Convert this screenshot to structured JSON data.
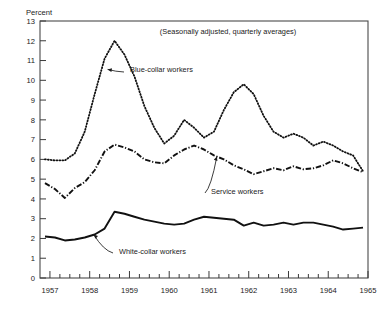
{
  "chart_data": {
    "type": "line",
    "title": "",
    "subtitle": "",
    "note": "(Seasonally adjusted, quarterly averages)",
    "ylabel": "Percent",
    "xlabel": "",
    "ylim": [
      0,
      13
    ],
    "xlim": [
      1956.75,
      1965.0
    ],
    "grid": false,
    "legend_position": "inline-annotations",
    "yticks": [
      0,
      1,
      2,
      3,
      4,
      5,
      6,
      7,
      8,
      9,
      10,
      11,
      12,
      13
    ],
    "ytick_labels": [
      "0",
      "1",
      "2",
      "3",
      "4",
      "5",
      "6",
      "7",
      "8",
      "9",
      "10",
      "11",
      "12",
      "13"
    ],
    "xticks": [
      1957,
      1958,
      1959,
      1960,
      1961,
      1962,
      1963,
      1964,
      1965
    ],
    "xtick_labels": [
      "1957",
      "1958",
      "1959",
      "1960",
      "1961",
      "1962",
      "1963",
      "1964",
      "1965"
    ],
    "x": [
      1956.875,
      1957.125,
      1957.375,
      1957.625,
      1957.875,
      1958.125,
      1958.375,
      1958.625,
      1958.875,
      1959.125,
      1959.375,
      1959.625,
      1959.875,
      1960.125,
      1960.375,
      1960.625,
      1960.875,
      1961.125,
      1961.375,
      1961.625,
      1961.875,
      1962.125,
      1962.375,
      1962.625,
      1962.875,
      1963.125,
      1963.375,
      1963.625,
      1963.875,
      1964.125,
      1964.375,
      1964.625,
      1964.875
    ],
    "series": [
      {
        "name": "Blue-collar workers",
        "style": "dotted",
        "color": "#111111",
        "values": [
          6.0,
          5.95,
          5.95,
          6.3,
          7.4,
          9.3,
          11.1,
          12.0,
          11.3,
          10.2,
          8.7,
          7.6,
          6.8,
          7.2,
          8.0,
          7.6,
          7.1,
          7.4,
          8.5,
          9.4,
          9.8,
          9.3,
          8.2,
          7.4,
          7.1,
          7.3,
          7.1,
          6.7,
          6.9,
          6.7,
          6.4,
          6.2,
          5.4
        ]
      },
      {
        "name": "Service workers",
        "style": "dash-dot",
        "color": "#111111",
        "values": [
          4.8,
          4.5,
          4.05,
          4.55,
          4.85,
          5.45,
          6.4,
          6.75,
          6.6,
          6.4,
          6.0,
          5.85,
          5.8,
          6.2,
          6.5,
          6.7,
          6.5,
          6.2,
          6.0,
          5.7,
          5.5,
          5.25,
          5.4,
          5.55,
          5.45,
          5.65,
          5.5,
          5.55,
          5.7,
          5.95,
          5.8,
          5.55,
          5.35
        ]
      },
      {
        "name": "White-collar workers",
        "style": "solid",
        "color": "#111111",
        "values": [
          2.1,
          2.05,
          1.9,
          1.95,
          2.05,
          2.2,
          2.5,
          3.35,
          3.25,
          3.1,
          2.95,
          2.85,
          2.75,
          2.7,
          2.75,
          2.95,
          3.1,
          3.05,
          3.0,
          2.95,
          2.65,
          2.8,
          2.65,
          2.7,
          2.8,
          2.7,
          2.8,
          2.8,
          2.7,
          2.6,
          2.45,
          2.5,
          2.55
        ]
      }
    ],
    "annotations": [
      {
        "label": "Blue-collar workers",
        "target_x": 1958.45,
        "target_y": 10.55
      },
      {
        "label": "Service workers",
        "target_x": 1961.2,
        "target_y": 6.15
      },
      {
        "label": "White-collar workers",
        "target_x": 1958.1,
        "target_y": 2.2
      }
    ]
  }
}
